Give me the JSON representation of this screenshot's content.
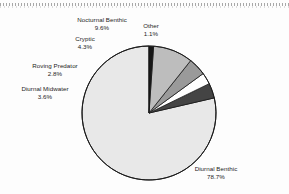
{
  "chart_data": {
    "type": "pie",
    "title": "",
    "subtitle": "",
    "xlabel": "",
    "ylabel": "",
    "legend_position": "none",
    "grid": false,
    "labels_placement": "outside-adjacent",
    "start_angle_deg": 90,
    "direction": "counterclockwise",
    "categories": [
      "Diurnal Benthic",
      "Other",
      "Nocturnal Benthic",
      "Cryptic",
      "Roving Predator",
      "Diurnal Midwater"
    ],
    "values": [
      78.7,
      1.1,
      9.6,
      4.3,
      2.8,
      3.6
    ],
    "unit": "%",
    "slices": [
      {
        "name": "Diurnal Benthic",
        "label": "Diurnal Benthic",
        "value": 78.7,
        "pct_text": "78.7%",
        "color": "#e8e8e8"
      },
      {
        "name": "Other",
        "label": "Other",
        "value": 1.1,
        "pct_text": "1.1%",
        "color": "#171717"
      },
      {
        "name": "Nocturnal Benthic",
        "label": "Nocturnal Benthic",
        "value": 9.6,
        "pct_text": "9.6%",
        "color": "#bdbdbd"
      },
      {
        "name": "Cryptic",
        "label": "Cryptic",
        "value": 4.3,
        "pct_text": "4.3%",
        "color": "#9a9a9a"
      },
      {
        "name": "Roving Predator",
        "label": "Roving Predator",
        "value": 2.8,
        "pct_text": "2.8%",
        "color": "#ffffff"
      },
      {
        "name": "Diurnal Midwater",
        "label": "Diurnal Midwater",
        "value": 3.6,
        "pct_text": "3.6%",
        "color": "#444444"
      }
    ],
    "outline_color": "#1c1c1c",
    "background": "#fdfdfd"
  }
}
